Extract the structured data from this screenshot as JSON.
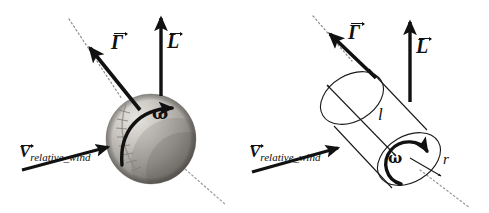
{
  "figure": {
    "background_color": "#ffffff",
    "ink_color": "#111111",
    "panels": [
      {
        "id": "sphere-panel",
        "body": "rotating-sphere",
        "labels": {
          "circulation": "Γ",
          "lift": "L",
          "spin": "ω",
          "wind_symbol": "V",
          "wind_subscript": "relative_wind"
        }
      },
      {
        "id": "cylinder-panel",
        "body": "rotating-cylinder",
        "labels": {
          "circulation": "Γ",
          "lift": "L",
          "spin": "ω",
          "length": "l",
          "radius": "r",
          "wind_symbol": "V",
          "wind_subscript": "relative_wind"
        }
      }
    ]
  },
  "colors": {
    "ink": "#111111",
    "outline": "#1a1a1a",
    "dotted_axis": "#8c8c8c",
    "sphere_light": "#dcdad6",
    "sphere_mid": "#a8a59f",
    "sphere_dark": "#6f6c67",
    "seam": "#8e8b85"
  }
}
